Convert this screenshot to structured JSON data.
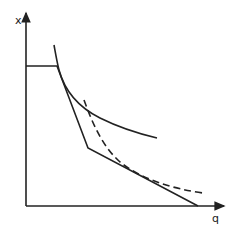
{
  "diagram": {
    "type": "economics-graph",
    "axes": {
      "y_label": "x",
      "x_label": "q"
    },
    "elements": [
      {
        "id": "budget-constraint-kinked",
        "style": "solid",
        "description": "Kinked constraint: horizontal segment from y-axis, steep segment down to kink, shallow segment to q-axis"
      },
      {
        "id": "indifference-curve-solid",
        "style": "solid",
        "description": "Convex curve tangent near upper corner"
      },
      {
        "id": "indifference-curve-dashed",
        "style": "dashed",
        "description": "Convex dashed curve tangent to lower segment"
      }
    ],
    "colors": {
      "ink": "#222222",
      "background": "#ffffff"
    }
  }
}
